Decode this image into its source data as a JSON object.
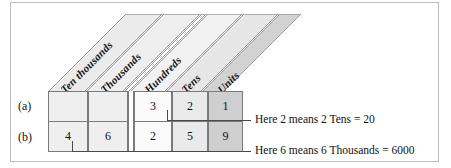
{
  "figure": {
    "title_hidden": "",
    "columns": [
      {
        "id": "ten-thousands",
        "label": "Ten thousands",
        "shade": "#e9e9e9"
      },
      {
        "id": "thousands",
        "label": "Thousands",
        "shade": "#ededed"
      },
      {
        "id": "hundreds",
        "label": "Hundreds",
        "shade": "#f0f0f0"
      },
      {
        "id": "tens",
        "label": "Tens",
        "shade": "#e4e4e4"
      },
      {
        "id": "units",
        "label": "Units",
        "shade": "#cfcfcf"
      }
    ],
    "rows": [
      {
        "id": "row-a",
        "label": "(a)",
        "digits": [
          "",
          "",
          "3",
          "2",
          "1"
        ]
      },
      {
        "id": "row-b",
        "label": "(b)",
        "digits": [
          "4",
          "6",
          "2",
          "5",
          "9"
        ]
      }
    ],
    "callouts": [
      {
        "id": "callout-tens",
        "text": "Here 2 means 2 Tens = 20"
      },
      {
        "id": "callout-thousands",
        "text": "Here 6 means 6 Thousands = 6000"
      }
    ],
    "colors": {
      "cell_border": "#7a7a7a",
      "frame_border": "#bdbdbd",
      "deck_stroke": "#9a9a9a",
      "leader": "#4a4a4a",
      "text": "#111111",
      "cell_row_a_fill": "#efefef",
      "cell_units_fill": "#cfcfcf"
    }
  }
}
